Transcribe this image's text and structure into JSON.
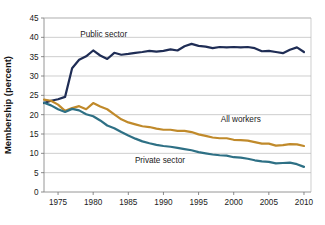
{
  "chart_data": {
    "type": "line",
    "title": "",
    "xlabel": "",
    "ylabel": "Membership (percent)",
    "xlim": [
      1973,
      2011
    ],
    "ylim": [
      0,
      45
    ],
    "yticks": [
      0,
      5,
      10,
      15,
      20,
      25,
      30,
      35,
      40,
      45
    ],
    "xticks": [
      1975,
      1980,
      1985,
      1990,
      1995,
      2000,
      2005,
      2010
    ],
    "ytick_labels": [
      "0",
      "5",
      "10",
      "15",
      "20",
      "25",
      "30",
      "35",
      "40",
      "45"
    ],
    "xtick_labels": [
      "1975",
      "1980",
      "1985",
      "1990",
      "1995",
      "2000",
      "2005",
      "2010"
    ],
    "grid": "horizontal",
    "legend_position": "inline-annotations",
    "x": [
      1973,
      1974,
      1975,
      1976,
      1977,
      1978,
      1979,
      1980,
      1981,
      1982,
      1983,
      1984,
      1985,
      1986,
      1987,
      1988,
      1989,
      1990,
      1991,
      1992,
      1993,
      1994,
      1995,
      1996,
      1997,
      1998,
      1999,
      2000,
      2001,
      2002,
      2003,
      2004,
      2005,
      2006,
      2007,
      2008,
      2009,
      2010
    ],
    "series": [
      {
        "name": "Public sector",
        "color": "#1F2D55",
        "label_x": 1981.5,
        "label_y": 40.2,
        "values": [
          23.0,
          23.6,
          24.0,
          24.6,
          32.0,
          34.2,
          35.1,
          36.6,
          35.3,
          34.4,
          36.0,
          35.5,
          35.7,
          36.0,
          36.2,
          36.5,
          36.3,
          36.5,
          36.9,
          36.6,
          37.7,
          38.3,
          37.8,
          37.6,
          37.2,
          37.5,
          37.4,
          37.5,
          37.4,
          37.5,
          37.2,
          36.4,
          36.5,
          36.2,
          35.9,
          36.8,
          37.4,
          36.2
        ]
      },
      {
        "name": "All workers",
        "color": "#C08A2B",
        "label_x": 2001.0,
        "label_y": 18.2,
        "values": [
          23.9,
          23.6,
          22.6,
          21.0,
          21.7,
          22.2,
          21.4,
          23.0,
          22.1,
          21.4,
          20.1,
          18.8,
          18.0,
          17.5,
          17.0,
          16.8,
          16.4,
          16.1,
          16.1,
          15.8,
          15.8,
          15.5,
          14.9,
          14.5,
          14.1,
          13.9,
          13.9,
          13.5,
          13.4,
          13.3,
          12.9,
          12.5,
          12.5,
          12.0,
          12.1,
          12.4,
          12.3,
          11.9
        ]
      },
      {
        "name": "Private sector",
        "color": "#2E7085",
        "label_x": 1989.5,
        "label_y": 7.4,
        "values": [
          23.1,
          22.4,
          21.4,
          20.7,
          21.5,
          21.1,
          20.1,
          19.6,
          18.5,
          17.2,
          16.5,
          15.5,
          14.6,
          13.8,
          13.1,
          12.6,
          12.2,
          11.9,
          11.7,
          11.4,
          11.1,
          10.8,
          10.3,
          10.0,
          9.7,
          9.5,
          9.4,
          9.0,
          8.9,
          8.6,
          8.2,
          7.9,
          7.8,
          7.4,
          7.5,
          7.6,
          7.2,
          6.5
        ]
      }
    ],
    "annotations": [
      {
        "text": "Public sector",
        "x": 1981.5,
        "y": 40.2
      },
      {
        "text": "All workers",
        "x": 2001.0,
        "y": 18.2
      },
      {
        "text": "Private sector",
        "x": 1989.5,
        "y": 7.4
      }
    ]
  },
  "axis": {
    "y_title": "Membership (percent)"
  }
}
